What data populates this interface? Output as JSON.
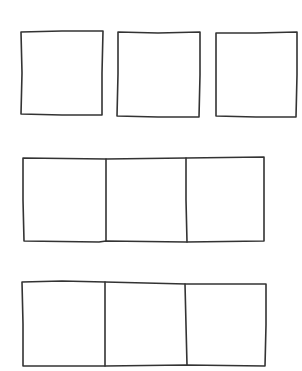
{
  "diagram": {
    "stroke_color": "#333333",
    "background": "#ffffff",
    "rows": [
      {
        "id": "row-1",
        "layout": "separated",
        "boxes": [
          {
            "x": 21,
            "y": 31,
            "w": 82,
            "h": 84
          },
          {
            "x": 117,
            "y": 32,
            "w": 83,
            "h": 85
          },
          {
            "x": 216,
            "y": 32,
            "w": 81,
            "h": 85
          }
        ]
      },
      {
        "id": "row-2",
        "layout": "joined",
        "frame": {
          "x": 23,
          "y": 157,
          "w": 241,
          "h": 85
        },
        "dividers": [
          106,
          186
        ]
      },
      {
        "id": "row-3",
        "layout": "joined",
        "frame": {
          "x": 22,
          "y": 281,
          "w": 244,
          "h": 85
        },
        "dividers": [
          105,
          186
        ]
      }
    ]
  }
}
